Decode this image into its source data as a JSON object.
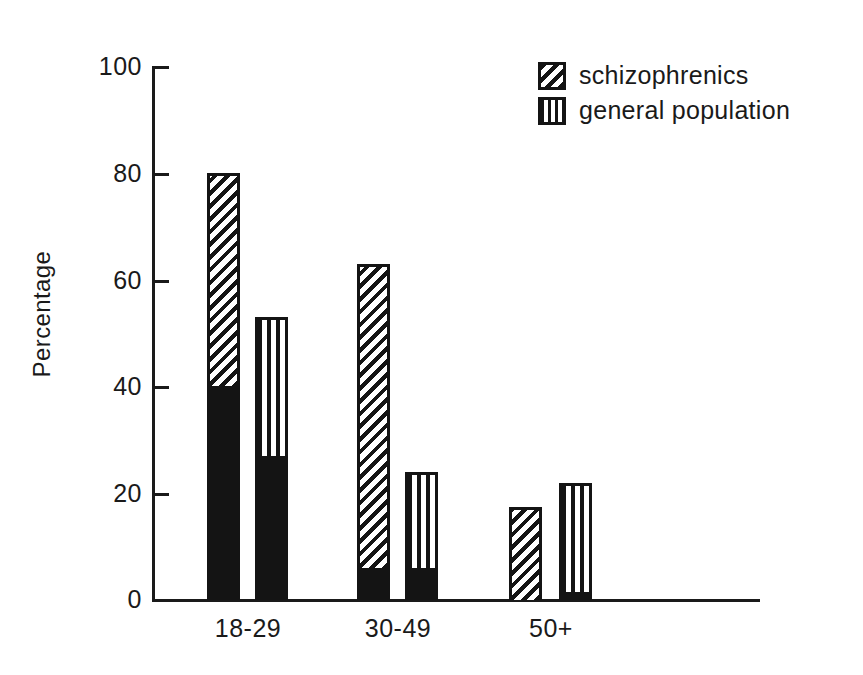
{
  "chart_data": {
    "type": "bar",
    "title": "",
    "subtitle": "",
    "xlabel": "",
    "ylabel": "Percentage",
    "categories": [
      "18-29",
      "30-49",
      "50+"
    ],
    "ylim": [
      0,
      100
    ],
    "yticks": [
      0,
      20,
      40,
      60,
      80,
      100
    ],
    "ytick_labels": [
      "0",
      "20",
      "40",
      "60",
      "80",
      "100"
    ],
    "grid": false,
    "legend_position": "top-right",
    "stacked": true,
    "note": "Each bar is stacked: a solid black lower segment and a patterned upper segment reaching the bar total.",
    "series": [
      {
        "name": "schizophrenics",
        "pattern": "diagonal-hatch",
        "color": "#141414",
        "totals": [
          80,
          63,
          17.5
        ],
        "solid_base": [
          40,
          6,
          0
        ],
        "patterned_upper": [
          40,
          57,
          17.5
        ]
      },
      {
        "name": "general population",
        "pattern": "vertical-stripes",
        "color": "#141414",
        "totals": [
          53,
          24,
          22
        ],
        "solid_base": [
          27,
          6,
          1.5
        ],
        "patterned_upper": [
          26,
          18,
          20.5
        ]
      }
    ]
  },
  "axis": {
    "y_title": "Percentage",
    "tick_0": "0",
    "tick_20": "20",
    "tick_40": "40",
    "tick_60": "60",
    "tick_80": "80",
    "tick_100": "100"
  },
  "categories": {
    "c0": "18-29",
    "c1": "30-49",
    "c2": "50+"
  },
  "legend": {
    "item0": "schizophrenics",
    "item1": "general population"
  }
}
